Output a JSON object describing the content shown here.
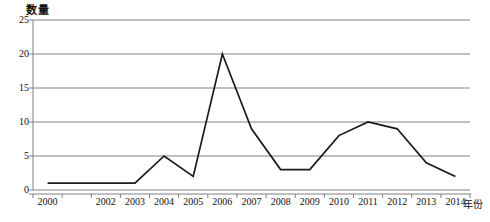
{
  "chart_data": {
    "type": "line",
    "title": "",
    "ylabel": "数量",
    "xlabel": "年份",
    "categories": [
      "2000",
      "2001",
      "2002",
      "2003",
      "2004",
      "2005",
      "2006",
      "2007",
      "2008",
      "2009",
      "2010",
      "2011",
      "2012",
      "2013",
      "2014"
    ],
    "tick_labels_visible": [
      "2000",
      "",
      "2002",
      "2003",
      "2004",
      "2005",
      "2006",
      "2007",
      "2008",
      "2009",
      "2010",
      "2011",
      "2012",
      "2013",
      "2014"
    ],
    "values": [
      1,
      1,
      1,
      1,
      5,
      2,
      20,
      9,
      3,
      3,
      8,
      10,
      9,
      4,
      2
    ],
    "series": [
      {
        "name": "数量",
        "values": [
          1,
          1,
          1,
          1,
          5,
          2,
          20,
          9,
          3,
          3,
          8,
          10,
          9,
          4,
          2
        ]
      }
    ],
    "ylim": [
      0,
      25
    ],
    "y_ticks": [
      0,
      5,
      10,
      15,
      20,
      25
    ],
    "grid": true,
    "grid_axis": "y",
    "legend": false,
    "legend_position": "none",
    "line_color": "#1a1a1a",
    "grid_color": "#808080",
    "axis_color": "#808080",
    "background_color": "#ffffff",
    "markers": false,
    "annotations": []
  }
}
